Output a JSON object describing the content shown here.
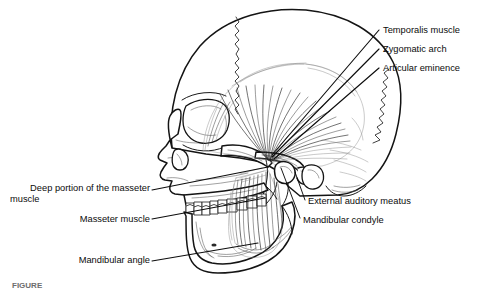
{
  "figure": {
    "background_color": "#ffffff",
    "ink_color": "#141414",
    "width": 500,
    "height": 289
  },
  "labels": {
    "temporalis_muscle": "Temporalis muscle",
    "zygomatic_arch": "Zygomatic arch",
    "articular_eminence": "Articular eminence",
    "external_auditory_meatus": "External auditory meatus",
    "mandibular_condyle": "Mandibular condyle",
    "deep_masseter_line1": "Deep portion of the masseter",
    "deep_masseter_line2": "muscle",
    "masseter_muscle": "Masseter muscle",
    "mandibular_angle": "Mandibular angle"
  },
  "caption": {
    "text": "FIGURE"
  },
  "annotations": [
    {
      "id": "temporalis-muscle",
      "label": "Temporalis muscle",
      "side": "right",
      "text_x": 383,
      "text_y": 33,
      "leader": "M379,30 L272,155"
    },
    {
      "id": "zygomatic-arch",
      "label": "Zygomatic arch",
      "side": "right",
      "text_x": 383,
      "text_y": 52,
      "leader": "M379,49 L272,157"
    },
    {
      "id": "articular-eminence",
      "label": "Articular eminence",
      "side": "right",
      "text_x": 383,
      "text_y": 71,
      "leader": "M379,68 L274,159"
    },
    {
      "id": "external-auditory-meatus",
      "label": "External auditory meatus",
      "side": "right",
      "text_x": 308,
      "text_y": 203,
      "leader": "M305,200 L295,172"
    },
    {
      "id": "mandibular-condyle",
      "label": "Mandibular condyle",
      "side": "right",
      "text_x": 303,
      "text_y": 222,
      "leader": "M300,218 L281,168"
    },
    {
      "id": "deep-masseter",
      "label": "Deep portion of the masseter muscle",
      "side": "left",
      "text_x": 150,
      "text_y": 191,
      "leader": "M152,190 L268,167"
    },
    {
      "id": "masseter-muscle",
      "label": "Masseter muscle",
      "side": "left",
      "text_x": 150,
      "text_y": 221,
      "leader": "M152,219 L265,198"
    },
    {
      "id": "mandibular-angle",
      "label": "Mandibular angle",
      "side": "left",
      "text_x": 150,
      "text_y": 262,
      "leader": "M152,261 L258,243"
    }
  ],
  "anatomy": {
    "structures": [
      "cranial-vault",
      "coronal-suture",
      "lambdoid-suture",
      "frontal-bone",
      "orbit",
      "nasal-aperture",
      "zygomatic-bone",
      "zygomatic-arch",
      "maxilla",
      "maxillary-teeth",
      "mandibular-teeth",
      "mandible-body",
      "mandibular-ramus",
      "mandibular-angle",
      "mandibular-condyle",
      "articular-eminence",
      "external-auditory-meatus",
      "mastoid-process",
      "temporalis-muscle",
      "masseter-muscle"
    ]
  }
}
